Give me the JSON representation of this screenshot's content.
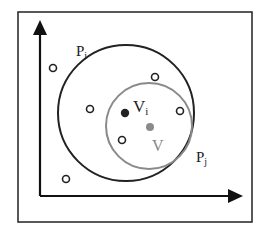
{
  "diagram": {
    "labels": {
      "outer_circle_main": "P",
      "outer_circle_sub": "i",
      "inner_circle_main": "P",
      "inner_circle_sub": "j",
      "dark_point_main": "V",
      "dark_point_sub": "i",
      "gray_point": "V"
    },
    "colors": {
      "outer_circle": "#222222",
      "inner_circle": "#8a8a8a",
      "dark_point": "#222222",
      "gray_point": "#8a8a8a",
      "axes": "#111111",
      "frame": "#222222"
    },
    "hollow_points": [
      {
        "x": 53,
        "y": 68
      },
      {
        "x": 155,
        "y": 77
      },
      {
        "x": 90,
        "y": 109
      },
      {
        "x": 180,
        "y": 111
      },
      {
        "x": 122,
        "y": 140
      },
      {
        "x": 66,
        "y": 179
      }
    ]
  }
}
